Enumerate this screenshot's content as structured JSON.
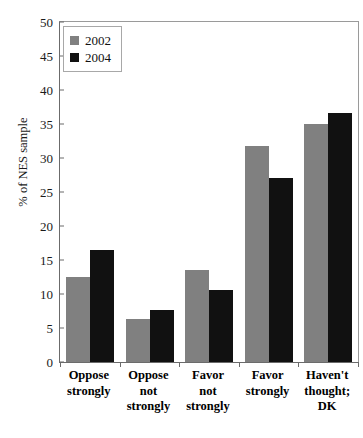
{
  "chart_data": {
    "type": "bar",
    "title": "",
    "subtitle": "",
    "xlabel": "",
    "ylabel": "% of NES sample",
    "ylim": [
      0,
      50
    ],
    "ytick_step": 5,
    "yticks": [
      0,
      5,
      10,
      15,
      20,
      25,
      30,
      35,
      40,
      45,
      50
    ],
    "ytick_labels": [
      "0",
      "5",
      "10",
      "15",
      "20",
      "25",
      "30",
      "35",
      "40",
      "45",
      "50"
    ],
    "grid": false,
    "legend_position": "top-left",
    "categories": [
      "Oppose strongly",
      "Oppose not strongly",
      "Favor not strongly",
      "Favor strongly",
      "Haven't thought; DK"
    ],
    "category_lines": [
      [
        "Oppose",
        "strongly"
      ],
      [
        "Oppose",
        "not",
        "strongly"
      ],
      [
        "Favor",
        "not",
        "strongly"
      ],
      [
        "Favor",
        "strongly"
      ],
      [
        "Haven't",
        "thought;",
        "DK"
      ]
    ],
    "series": [
      {
        "name": "2002",
        "color": "#808080",
        "values": [
          12.5,
          6.3,
          13.6,
          31.7,
          35.0
        ]
      },
      {
        "name": "2004",
        "color": "#111111",
        "values": [
          16.5,
          7.6,
          10.6,
          27.1,
          36.6
        ]
      }
    ]
  },
  "legend": {
    "items": [
      {
        "label": "2002",
        "swatch": "gray-square-icon"
      },
      {
        "label": "2004",
        "swatch": "black-square-icon"
      }
    ]
  },
  "colors": {
    "series_2002": "#808080",
    "series_2004": "#111111",
    "axis": "#6b6b6b",
    "text": "#111111",
    "background": "#ffffff"
  }
}
